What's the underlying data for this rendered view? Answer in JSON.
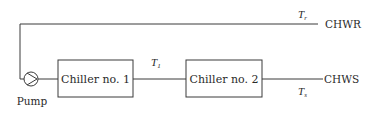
{
  "diagram": {
    "type": "chilled-water-loop-schematic",
    "components": {
      "pump": {
        "label": "Pump",
        "icon": "pump-icon"
      },
      "chiller1": {
        "label": "Chiller no. 1"
      },
      "chiller2": {
        "label": "Chiller no. 2"
      }
    },
    "streams": {
      "return": {
        "label": "CHWR",
        "temp_var": "T",
        "temp_sub": "r"
      },
      "supply": {
        "label": "CHWS",
        "temp_var": "T",
        "temp_sub": "s"
      },
      "intermediate": {
        "temp_var": "T",
        "temp_sub": "1"
      }
    },
    "colors": {
      "stroke": "#3a3a3a",
      "text": "#2a2a2a",
      "background": "#ffffff"
    }
  }
}
